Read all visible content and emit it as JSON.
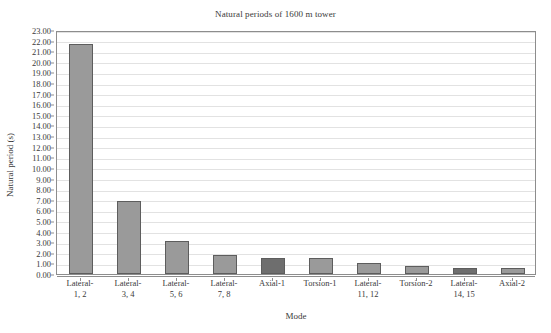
{
  "chart_data": {
    "type": "bar",
    "title": "Natural periods of 1600 m tower",
    "xlabel": "Mode",
    "ylabel": "Natural period (s)",
    "categories": [
      "Lateral-\n1, 2",
      "Lateral-\n3, 4",
      "Lateral-\n5, 6",
      "Lateral-\n7, 8",
      "Axial-1",
      "Torsion-1",
      "Lateral-\n11, 12",
      "Torsion-2",
      "Lateral-\n14, 15",
      "Axial-2"
    ],
    "category_lines": [
      [
        "Lateral-",
        "1, 2"
      ],
      [
        "Lateral-",
        "3, 4"
      ],
      [
        "Lateral-",
        "5, 6"
      ],
      [
        "Lateral-",
        "7, 8"
      ],
      [
        "Axial-1",
        ""
      ],
      [
        "Torsion-1",
        ""
      ],
      [
        "Lateral-",
        "11, 12"
      ],
      [
        "Torsion-2",
        ""
      ],
      [
        "Lateral-",
        "14, 15"
      ],
      [
        "Axial-2",
        ""
      ]
    ],
    "values": [
      21.7,
      6.85,
      3.1,
      1.75,
      1.5,
      1.5,
      1.05,
      0.75,
      0.6,
      0.55
    ],
    "bar_colors": [
      "#9a9a9a",
      "#9a9a9a",
      "#9a9a9a",
      "#9a9a9a",
      "#6e6e6e",
      "#9a9a9a",
      "#9a9a9a",
      "#9a9a9a",
      "#6e6e6e",
      "#9a9a9a"
    ],
    "bar_edge_color": "#5d5d5d",
    "ylim": [
      0.0,
      23.0
    ],
    "ytick_step": 1.0,
    "yticks": [
      "23.00",
      "22.00",
      "21.00",
      "20.00",
      "19.00",
      "18.00",
      "17.00",
      "16.00",
      "15.00",
      "14.00",
      "13.00",
      "12.00",
      "11.00",
      "10.00",
      "9.00",
      "8.00",
      "7.00",
      "6.00",
      "5.00",
      "4.00",
      "3.00",
      "2.00",
      "1.00",
      "0.00"
    ],
    "ytick_values": [
      23,
      22,
      21,
      20,
      19,
      18,
      17,
      16,
      15,
      14,
      13,
      12,
      11,
      10,
      9,
      8,
      7,
      6,
      5,
      4,
      3,
      2,
      1,
      0
    ],
    "grid": {
      "horizontal": true,
      "vertical": false,
      "color": "#e2e2e2"
    },
    "legend": null,
    "axis_color": "#8d8d8d",
    "background": "#ffffff"
  }
}
